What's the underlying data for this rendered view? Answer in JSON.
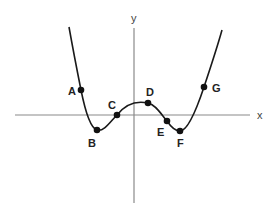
{
  "diagram": {
    "type": "function-graph",
    "axes": {
      "x_label": "x",
      "y_label": "y"
    },
    "points": [
      {
        "label": "A",
        "x": 81,
        "y": 90,
        "description": "on decreasing branch, above x-axis"
      },
      {
        "label": "B",
        "x": 97,
        "y": 130,
        "description": "local minimum below x-axis"
      },
      {
        "label": "C",
        "x": 117,
        "y": 115,
        "description": "x-intercept, increasing"
      },
      {
        "label": "D",
        "x": 148,
        "y": 103,
        "description": "local maximum above x-axis"
      },
      {
        "label": "E",
        "x": 167,
        "y": 121,
        "description": "decreasing, just below x-axis"
      },
      {
        "label": "F",
        "x": 180,
        "y": 131,
        "description": "local minimum below x-axis"
      },
      {
        "label": "G",
        "x": 204,
        "y": 87,
        "description": "on increasing branch, above x-axis"
      }
    ]
  }
}
